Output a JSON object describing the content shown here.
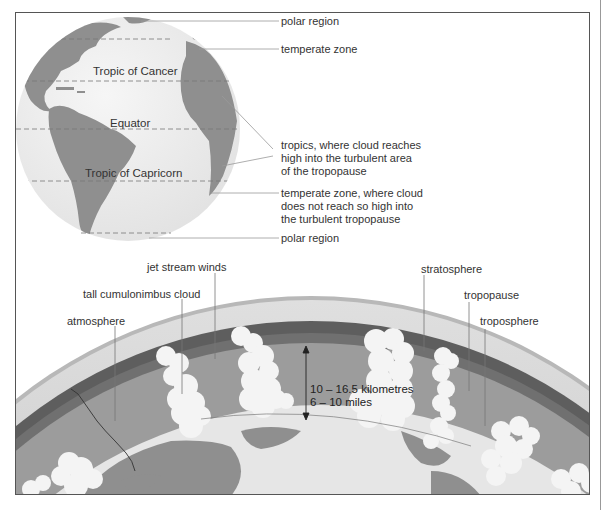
{
  "globe": {
    "latitudes": {
      "tropic_cancer": "Tropic of Cancer",
      "equator": "Equator",
      "tropic_capricorn": "Tropic of Capricorn"
    },
    "callouts": {
      "polar_top": "polar region",
      "temperate_top": "temperate zone",
      "tropics": [
        "tropics, where cloud reaches",
        "high into the turbulent area",
        "of the tropopause"
      ],
      "temperate_bottom": [
        "temperate zone, where cloud",
        "does not reach so high into",
        "the turbulent tropopause"
      ],
      "polar_bottom": "polar region"
    }
  },
  "atmosphere": {
    "labels": {
      "jet_stream": "jet stream winds",
      "cumulonimbus": "tall cumulonimbus cloud",
      "atmosphere": "atmosphere",
      "stratosphere": "stratosphere",
      "tropopause": "tropopause",
      "troposphere": "troposphere"
    },
    "height_km": "10 – 16.5 kilometres",
    "height_miles": "6 – 10 miles"
  },
  "colors": {
    "land": "#8f8f8f",
    "ocean": "#ececec",
    "stratosphere_band": "#5a5a5a",
    "troposphere_band": "#9a9a9a",
    "cloud": "#f4f4f4",
    "leader_line": "#888888"
  }
}
